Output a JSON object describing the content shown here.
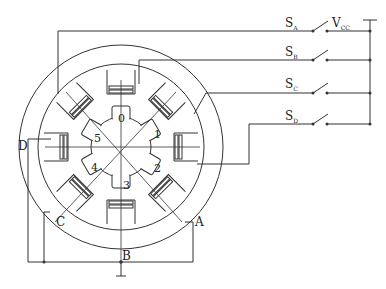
{
  "diagram": {
    "type": "stepper-motor-wiring",
    "phase_labels": {
      "A": "A",
      "B": "B",
      "C": "C",
      "D": "D"
    },
    "rotor_teeth": [
      "0",
      "1",
      "2",
      "3",
      "4",
      "5"
    ],
    "switches": [
      {
        "name": "S",
        "sub": "A"
      },
      {
        "name": "S",
        "sub": "B"
      },
      {
        "name": "S",
        "sub": "C"
      },
      {
        "name": "S",
        "sub": "D"
      }
    ],
    "supply": {
      "name": "V",
      "sub": "CC"
    },
    "colors": {
      "line": "#333333",
      "background": "#ffffff"
    }
  }
}
